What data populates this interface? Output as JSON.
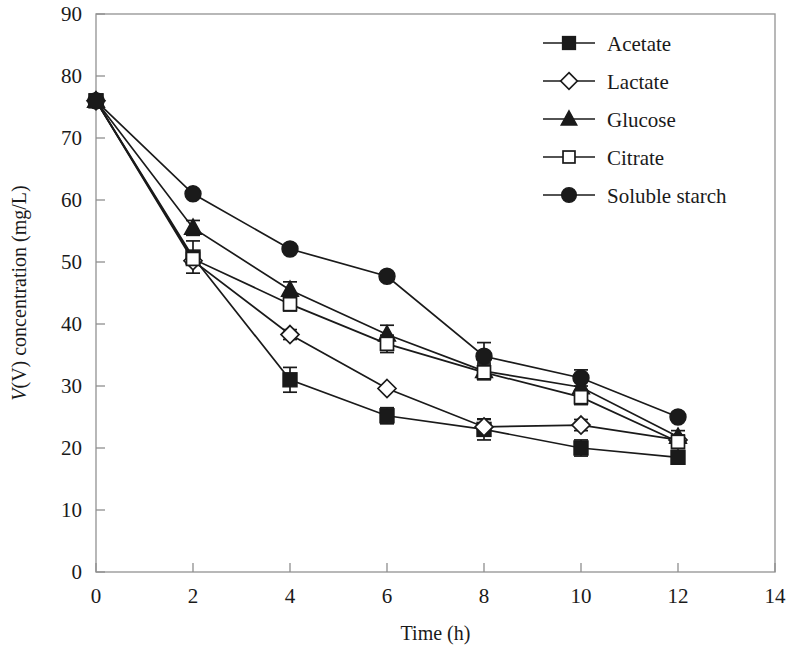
{
  "figure": {
    "background_color": "#ffffff",
    "ink_color": "#1a1a1a",
    "frame_color": "#9a9a9a"
  },
  "chart_data": {
    "type": "line",
    "title": "",
    "subtitle": "",
    "xlabel": "Time (h)",
    "ylabel": "V(V) concentration (mg/L)",
    "ylabel_italic_prefix": "V",
    "ylabel_rest": "(V) concentration (mg/L)",
    "xlim": [
      0,
      14
    ],
    "ylim": [
      0,
      90
    ],
    "xticks": [
      0,
      2,
      4,
      6,
      8,
      10,
      12,
      14
    ],
    "yticks": [
      0,
      10,
      20,
      30,
      40,
      50,
      60,
      70,
      80,
      90
    ],
    "xtick_labels": [
      "0",
      "2",
      "4",
      "6",
      "8",
      "10",
      "12",
      "14"
    ],
    "ytick_labels": [
      "0",
      "10",
      "20",
      "30",
      "40",
      "50",
      "60",
      "70",
      "80",
      "90"
    ],
    "grid": false,
    "legend_position": "top-right",
    "x": [
      0,
      2,
      4,
      6,
      8,
      10,
      12
    ],
    "series": [
      {
        "name": "Acetate",
        "marker": "filled-square",
        "values": [
          76.0,
          50.8,
          31.0,
          25.2,
          23.0,
          20.0,
          18.5
        ],
        "errors": [
          0.0,
          2.6,
          2.0,
          1.3,
          1.7,
          1.3,
          1.1
        ]
      },
      {
        "name": "Lactate",
        "marker": "open-diamond",
        "values": [
          76.0,
          50.2,
          38.3,
          29.6,
          23.4,
          23.7,
          21.3
        ],
        "errors": [
          0.0,
          0.0,
          0.8,
          0.0,
          1.2,
          0.9,
          0.8
        ]
      },
      {
        "name": "Glucose",
        "marker": "filled-triangle",
        "values": [
          76.0,
          55.5,
          45.5,
          38.3,
          32.4,
          29.8,
          21.8
        ],
        "errors": [
          0.0,
          1.2,
          1.3,
          1.5,
          1.3,
          1.4,
          1.0
        ]
      },
      {
        "name": "Citrate",
        "marker": "open-square",
        "values": [
          76.0,
          50.5,
          43.2,
          36.8,
          32.2,
          28.2,
          21.0
        ],
        "errors": [
          0.0,
          1.0,
          1.1,
          1.4,
          1.2,
          1.2,
          0.9
        ]
      },
      {
        "name": "Soluble starch",
        "marker": "filled-circle",
        "values": [
          76.0,
          61.0,
          52.1,
          47.7,
          34.8,
          31.3,
          25.0
        ],
        "errors": [
          0.0,
          0.0,
          0.0,
          0.0,
          2.2,
          1.3,
          0.0
        ]
      }
    ]
  },
  "legend": {
    "items": [
      {
        "label": "Acetate",
        "marker": "filled-square"
      },
      {
        "label": "Lactate",
        "marker": "open-diamond"
      },
      {
        "label": "Glucose",
        "marker": "filled-triangle"
      },
      {
        "label": "Citrate",
        "marker": "open-square"
      },
      {
        "label": "Soluble starch",
        "marker": "filled-circle"
      }
    ]
  }
}
